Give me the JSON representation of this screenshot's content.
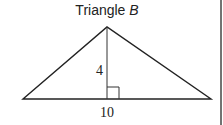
{
  "title": {
    "prefix": "Triangle ",
    "variable": "B"
  },
  "diagram": {
    "shape": "triangle",
    "height_label": "4",
    "base_label": "10",
    "right_angle_marker": true,
    "vertices": {
      "left": [
        23,
        99
      ],
      "apex": [
        107,
        27
      ],
      "right": [
        211,
        99
      ]
    },
    "foot_of_altitude": [
      107,
      99
    ],
    "stroke_color": "#222222"
  },
  "frame": {
    "right_border": true,
    "border_color": "#444444"
  }
}
